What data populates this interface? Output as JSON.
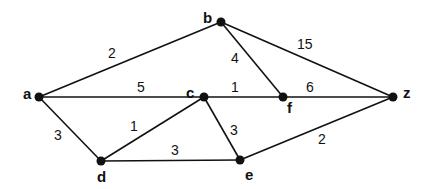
{
  "diagram": {
    "type": "weighted-undirected-graph",
    "nodes": [
      {
        "id": "a",
        "label": "a",
        "x": 39,
        "y": 97,
        "lx": 23,
        "ly": 99
      },
      {
        "id": "b",
        "label": "b",
        "x": 221,
        "y": 22,
        "lx": 203,
        "ly": 23
      },
      {
        "id": "c",
        "label": "c",
        "x": 204,
        "y": 97,
        "lx": 186,
        "ly": 98
      },
      {
        "id": "f",
        "label": "f",
        "x": 283,
        "y": 97,
        "lx": 287,
        "ly": 113
      },
      {
        "id": "z",
        "label": "z",
        "x": 393,
        "y": 97,
        "lx": 403,
        "ly": 98
      },
      {
        "id": "d",
        "label": "d",
        "x": 101,
        "y": 161,
        "lx": 97,
        "ly": 182
      },
      {
        "id": "e",
        "label": "e",
        "x": 240,
        "y": 160,
        "lx": 245,
        "ly": 180
      }
    ],
    "edges": [
      {
        "from": "a",
        "to": "b",
        "weight": "2",
        "wx": 108,
        "wy": 58
      },
      {
        "from": "a",
        "to": "c",
        "weight": "5",
        "wx": 137,
        "wy": 92
      },
      {
        "from": "c",
        "to": "f",
        "weight": "1",
        "wx": 231,
        "wy": 92
      },
      {
        "from": "f",
        "to": "z",
        "weight": "6",
        "wx": 306,
        "wy": 92
      },
      {
        "from": "b",
        "to": "f",
        "weight": "4",
        "wx": 231,
        "wy": 63
      },
      {
        "from": "b",
        "to": "z",
        "weight": "15",
        "wx": 297,
        "wy": 49
      },
      {
        "from": "a",
        "to": "d",
        "weight": "3",
        "wx": 54,
        "wy": 140
      },
      {
        "from": "d",
        "to": "c",
        "weight": "1",
        "wx": 130,
        "wy": 131
      },
      {
        "from": "d",
        "to": "e",
        "weight": "3",
        "wx": 171,
        "wy": 155
      },
      {
        "from": "c",
        "to": "e",
        "weight": "3",
        "wx": 230,
        "wy": 135
      },
      {
        "from": "e",
        "to": "z",
        "weight": "2",
        "wx": 318,
        "wy": 144
      }
    ]
  }
}
